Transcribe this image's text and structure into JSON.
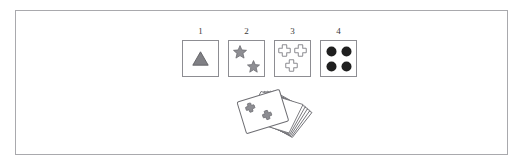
{
  "canvas": {
    "width": 523,
    "height": 166,
    "background_color": "#ffffff",
    "border_color": "#a9a9ad"
  },
  "colors": {
    "card_border": "#8d8d92",
    "card_fill": "#ffffff",
    "triangle_fill": "#808085",
    "triangle_stroke": "#5f5f63",
    "star_fill": "#8e8e93",
    "star_stroke": "#6b6b70",
    "cross_fill": "#ffffff",
    "cross_stroke": "#8d8d92",
    "dot_fill": "#1f1f1f",
    "deck_card_fill": "#ffffff",
    "deck_card_stroke": "#6e6e73",
    "deck_symbol_fill": "#8e8e93",
    "number_color": "#3a3a3a"
  },
  "cards": [
    {
      "number": "1",
      "symbol": "triangle",
      "symbol_count": 1,
      "symbol_style": "filled",
      "positions": [
        "center"
      ]
    },
    {
      "number": "2",
      "symbol": "star",
      "symbol_count": 2,
      "symbol_style": "filled",
      "positions": [
        "top-left",
        "bottom-right"
      ]
    },
    {
      "number": "3",
      "symbol": "cross",
      "symbol_count": 3,
      "symbol_style": "outline",
      "positions": [
        "top-left",
        "top-right",
        "bottom-left"
      ]
    },
    {
      "number": "4",
      "symbol": "dot",
      "symbol_count": 4,
      "symbol_style": "filled",
      "positions": [
        "top-left",
        "top-right",
        "bottom-left",
        "bottom-right"
      ]
    }
  ],
  "deck": {
    "name": "card-deck",
    "card_count": 6,
    "top_card_symbol": "cross",
    "top_card_symbol_count": 2,
    "rotated": true
  }
}
